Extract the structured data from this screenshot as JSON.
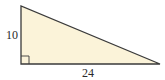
{
  "diagram": {
    "type": "right-triangle",
    "fill_color": "#fbf3d9",
    "stroke_color": "#3a3a3a",
    "right_angle_marker": true,
    "labels": {
      "vertical_leg": "10",
      "horizontal_leg": "24"
    }
  }
}
